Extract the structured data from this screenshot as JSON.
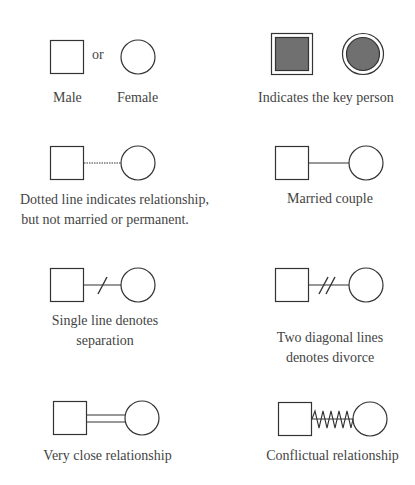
{
  "legend": {
    "items": [
      {
        "id": "gender",
        "symbols": [
          "square",
          "circle"
        ],
        "connector_text": "or",
        "labels": [
          "Male",
          "Female"
        ]
      },
      {
        "id": "key-person",
        "symbols": [
          "double-square-filled",
          "double-circle-filled"
        ],
        "label": "Indicates the key person"
      },
      {
        "id": "dotted",
        "connector": "dotted-line",
        "label_lines": [
          "Dotted line indicates relationship,",
          "but not married or permanent."
        ]
      },
      {
        "id": "married",
        "connector": "solid-line",
        "label": "Married couple"
      },
      {
        "id": "separation",
        "connector": "single-slash-line",
        "label_lines": [
          "Single line denotes",
          "separation"
        ]
      },
      {
        "id": "divorce",
        "connector": "double-slash-line",
        "label_lines": [
          "Two diagonal lines",
          "denotes divorce"
        ]
      },
      {
        "id": "close",
        "connector": "double-line",
        "label": "Very close relationship"
      },
      {
        "id": "conflict",
        "connector": "zigzag-line",
        "label": "Conflictual relationship"
      }
    ]
  },
  "colors": {
    "stroke": "#333333",
    "fill_key": "#707070",
    "text": "#444444"
  }
}
